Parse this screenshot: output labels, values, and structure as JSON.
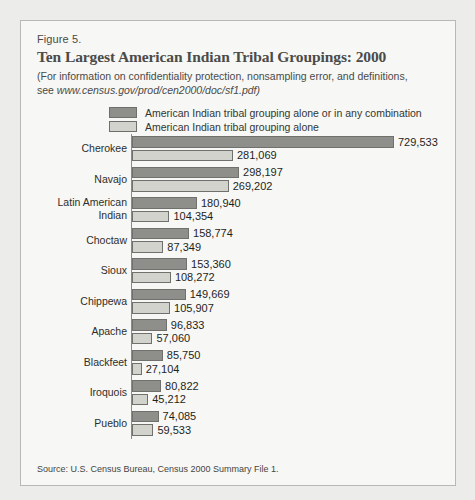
{
  "figure": {
    "number": "Figure 5.",
    "title": "Ten Largest American Indian Tribal Groupings: 2000",
    "subtitle_line1": "(For information on confidentiality protection, nonsampling error, and definitions,",
    "subtitle_see": "see",
    "subtitle_url": "www.census.gov/prod/cen2000/doc/sf1.pdf)",
    "source": "Source: U.S. Census Bureau, Census 2000 Summary File 1."
  },
  "legend": {
    "items": [
      {
        "label": "American Indian tribal grouping alone or in any combination",
        "color": "#8e8e8a",
        "swatch": "dark"
      },
      {
        "label": "American Indian tribal grouping alone",
        "color": "#d3d3ce",
        "swatch": "light"
      }
    ]
  },
  "colors": {
    "combination": "#8e8e8a",
    "alone": "#d3d3ce",
    "bar_border": "#70706d",
    "axis": "#8b8b86",
    "frame": "#b9b9b4",
    "panel_bg": "#f7f7f5",
    "page_bg": "#ececeb",
    "title_text": "#4b4b49"
  },
  "chart_data": {
    "type": "bar",
    "orientation": "horizontal",
    "title": "Ten Largest American Indian Tribal Groupings: 2000",
    "xlabel": "",
    "ylabel": "",
    "xlim": [
      0,
      729533
    ],
    "grid": false,
    "legend_position": "top",
    "categories": [
      "Cherokee",
      "Navajo",
      "Latin American Indian",
      "Choctaw",
      "Sioux",
      "Chippewa",
      "Apache",
      "Blackfeet",
      "Iroquois",
      "Pueblo"
    ],
    "series": [
      {
        "name": "American Indian tribal grouping alone or in any combination",
        "values": [
          729533,
          298197,
          180940,
          158774,
          153360,
          149669,
          96833,
          85750,
          80822,
          74085
        ],
        "labels": [
          "729,533",
          "298,197",
          "180,940",
          "158,774",
          "153,360",
          "149,669",
          "96,833",
          "85,750",
          "80,822",
          "74,085"
        ]
      },
      {
        "name": "American Indian tribal grouping alone",
        "values": [
          281069,
          269202,
          104354,
          87349,
          108272,
          105907,
          57060,
          27104,
          45212,
          59533
        ],
        "labels": [
          "281,069",
          "269,202",
          "104,354",
          "87,349",
          "108,272",
          "105,907",
          "57,060",
          "27,104",
          "45,212",
          "59,533"
        ]
      }
    ]
  },
  "rows": [
    {
      "label": "Cherokee",
      "label_lines": [
        "Cherokee"
      ],
      "combination": "729,533",
      "alone": "281,069",
      "combination_value": 729533,
      "alone_value": 281069
    },
    {
      "label": "Navajo",
      "label_lines": [
        "Navajo"
      ],
      "combination": "298,197",
      "alone": "269,202",
      "combination_value": 298197,
      "alone_value": 269202
    },
    {
      "label": "Latin American Indian",
      "label_lines": [
        "Latin American",
        "Indian"
      ],
      "combination": "180,940",
      "alone": "104,354",
      "combination_value": 180940,
      "alone_value": 104354
    },
    {
      "label": "Choctaw",
      "label_lines": [
        "Choctaw"
      ],
      "combination": "158,774",
      "alone": "87,349",
      "combination_value": 158774,
      "alone_value": 87349
    },
    {
      "label": "Sioux",
      "label_lines": [
        "Sioux"
      ],
      "combination": "153,360",
      "alone": "108,272",
      "combination_value": 153360,
      "alone_value": 108272
    },
    {
      "label": "Chippewa",
      "label_lines": [
        "Chippewa"
      ],
      "combination": "149,669",
      "alone": "105,907",
      "combination_value": 149669,
      "alone_value": 105907
    },
    {
      "label": "Apache",
      "label_lines": [
        "Apache"
      ],
      "combination": "96,833",
      "alone": "57,060",
      "combination_value": 96833,
      "alone_value": 57060
    },
    {
      "label": "Blackfeet",
      "label_lines": [
        "Blackfeet"
      ],
      "combination": "85,750",
      "alone": "27,104",
      "combination_value": 85750,
      "alone_value": 27104
    },
    {
      "label": "Iroquois",
      "label_lines": [
        "Iroquois"
      ],
      "combination": "80,822",
      "alone": "45,212",
      "combination_value": 80822,
      "alone_value": 45212
    },
    {
      "label": "Pueblo",
      "label_lines": [
        "Pueblo"
      ],
      "combination": "74,085",
      "alone": "59,533",
      "combination_value": 74085,
      "alone_value": 59533
    }
  ]
}
